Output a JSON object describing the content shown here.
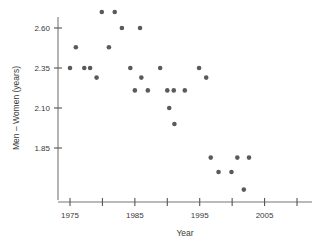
{
  "chart_data": {
    "type": "scatter",
    "title": "",
    "xlabel": "Year",
    "ylabel": "Men – Women (years)",
    "xlim": [
      1973,
      2011
    ],
    "ylim": [
      1.54,
      2.75
    ],
    "grid": false,
    "legend": null,
    "x_ticks": [
      1975,
      1980,
      1985,
      1990,
      1995,
      2000,
      2005,
      2010
    ],
    "x_tick_labels": [
      "1975",
      "",
      "1985",
      "",
      "1995",
      "",
      "2005",
      ""
    ],
    "y_ticks": [
      1.85,
      2.1,
      2.35,
      2.6
    ],
    "y_tick_labels": [
      "1.85",
      "2.10",
      "2.35",
      "2.60"
    ],
    "marker": "circle",
    "marker_color": "#5a5a5a",
    "marker_size": 4.6,
    "points": [
      {
        "x": 1975.0,
        "y": 2.35
      },
      {
        "x": 1975.9,
        "y": 2.48
      },
      {
        "x": 1977.2,
        "y": 2.35
      },
      {
        "x": 1978.1,
        "y": 2.35
      },
      {
        "x": 1979.1,
        "y": 2.29
      },
      {
        "x": 1979.9,
        "y": 2.7
      },
      {
        "x": 1981.9,
        "y": 2.7
      },
      {
        "x": 1981.0,
        "y": 2.48
      },
      {
        "x": 1983.0,
        "y": 2.6
      },
      {
        "x": 1985.8,
        "y": 2.6
      },
      {
        "x": 1984.3,
        "y": 2.35
      },
      {
        "x": 1985.0,
        "y": 2.21
      },
      {
        "x": 1987.0,
        "y": 2.21
      },
      {
        "x": 1986.0,
        "y": 2.29
      },
      {
        "x": 1988.9,
        "y": 2.35
      },
      {
        "x": 1990.0,
        "y": 2.21
      },
      {
        "x": 1991.0,
        "y": 2.21
      },
      {
        "x": 1990.3,
        "y": 2.1
      },
      {
        "x": 1992.7,
        "y": 2.21
      },
      {
        "x": 1991.1,
        "y": 2.0
      },
      {
        "x": 1994.9,
        "y": 2.35
      },
      {
        "x": 1996.0,
        "y": 2.29
      },
      {
        "x": 1996.7,
        "y": 1.79
      },
      {
        "x": 1997.9,
        "y": 1.7
      },
      {
        "x": 1999.9,
        "y": 1.7
      },
      {
        "x": 2000.8,
        "y": 1.79
      },
      {
        "x": 2002.6,
        "y": 1.79
      },
      {
        "x": 2001.8,
        "y": 1.59
      }
    ]
  },
  "axis": {
    "x_title": "Year",
    "y_title": "Men – Women (years)"
  }
}
